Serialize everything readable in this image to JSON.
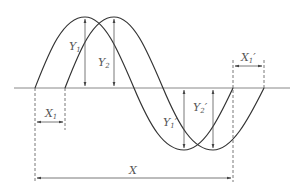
{
  "diagram": {
    "type": "wave-displacement-diagram",
    "colors": {
      "curve": "#333333",
      "baseline": "#888888",
      "dimension": "#555555",
      "label": "#555555"
    },
    "labels": {
      "y1": {
        "main": "Y",
        "sub": "1",
        "prime": ""
      },
      "y2": {
        "main": "Y",
        "sub": "2",
        "prime": ""
      },
      "y1p": {
        "main": "Y",
        "sub": "1",
        "prime": "′"
      },
      "y2p": {
        "main": "Y",
        "sub": "2",
        "prime": "′"
      },
      "x1": {
        "main": "X",
        "sub": "1",
        "prime": ""
      },
      "x1p": {
        "main": "X",
        "sub": "1",
        "prime": "′"
      },
      "x": {
        "main": "X",
        "sub": "",
        "prime": ""
      }
    }
  }
}
